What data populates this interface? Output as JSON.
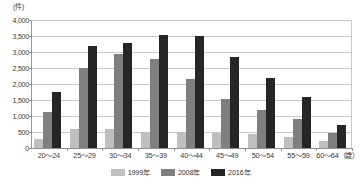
{
  "chart_data": {
    "type": "bar",
    "title": "",
    "subtitle": "",
    "xlabel": "",
    "ylabel": "(件)",
    "unit_label": "(件)",
    "ylim": [
      0,
      4000
    ],
    "ytick_step": 500,
    "ytick_labels": [
      "4,000",
      "3,500",
      "3,000",
      "2,500",
      "2,000",
      "1,500",
      "1,000",
      "500",
      "0"
    ],
    "ytick_values": [
      4000,
      3500,
      3000,
      2500,
      2000,
      1500,
      1000,
      500,
      0
    ],
    "grid": true,
    "legend_position": "bottom",
    "categories": [
      "20～24",
      "25～29",
      "30～34",
      "35～39",
      "40～44",
      "45～49",
      "50～54",
      "55～59",
      "60～64（歳）"
    ],
    "series": [
      {
        "name": "1999年",
        "color": "#bfbfbf",
        "values": [
          280,
          580,
          580,
          500,
          490,
          470,
          450,
          330,
          230
        ]
      },
      {
        "name": "2008年",
        "color": "#7f7f7f",
        "values": [
          1130,
          2490,
          2950,
          2780,
          2150,
          1530,
          1180,
          900,
          480
        ]
      },
      {
        "name": "2016年",
        "color": "#262626",
        "values": [
          1740,
          3200,
          3290,
          3520,
          3500,
          2830,
          2200,
          1600,
          720
        ]
      }
    ]
  }
}
